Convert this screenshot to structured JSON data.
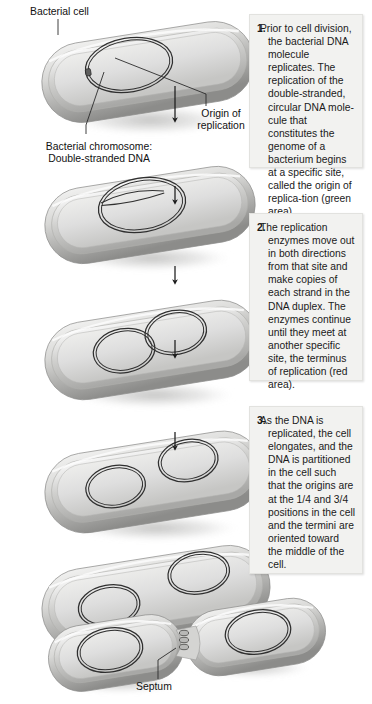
{
  "figure": {
    "background_color": "#ffffff"
  },
  "labels": {
    "bacterial_cell": "Bacterial cell",
    "origin_of_replication": "Origin of\nreplication",
    "bacterial_chromosome": "Bacterial chromosome:\nDouble-stranded DNA",
    "septum": "Septum"
  },
  "panels": [
    {
      "number": "1.",
      "text": "Prior to cell division, the bacterial DNA molecule replicates. The replication of the double-stranded, circular DNA mole-cule that constitutes the genome of a bacterium begins at a specific site, called the origin of replica-tion (green area)."
    },
    {
      "number": "2.",
      "text": "The replication enzymes move out in both directions from that site and make copies of each strand in the DNA duplex. The enzymes continue until they meet at another specific site, the terminus of replication (red area)."
    },
    {
      "number": "3.",
      "text": "As the DNA is replicated, the cell elongates, and the DNA is partitioned in the cell such that the origins are at the 1/4 and 3/4 positions in the cell and the termini are oriented toward the middle of the cell."
    }
  ],
  "stages": [
    {
      "id": "stage-1",
      "caption": "Single circular chromosome with origin of replication",
      "dna_loops": 1
    },
    {
      "id": "stage-2",
      "caption": "Replication begins, bubble forms at origin",
      "dna_loops": 1
    },
    {
      "id": "stage-3",
      "caption": "Two overlapping replicating loops",
      "dna_loops": 2
    },
    {
      "id": "stage-4",
      "caption": "Two separating chromosome loops",
      "dna_loops": 2
    },
    {
      "id": "stage-5",
      "caption": "Cell elongates, chromosomes at 1/4 and 3/4 positions",
      "dna_loops": 2
    },
    {
      "id": "stage-6",
      "caption": "Septum forms, cell divides into two daughter cells",
      "dna_loops": 2
    }
  ],
  "arrows": [
    {
      "id": "arrow-1"
    },
    {
      "id": "arrow-2"
    },
    {
      "id": "arrow-3"
    },
    {
      "id": "arrow-4"
    },
    {
      "id": "arrow-5"
    }
  ],
  "colors": {
    "panel_background": "#f2f2f0",
    "panel_border": "#e2e2df",
    "cell_light": "#e6e6e4",
    "cell_mid": "#c8c8c6",
    "cell_dark": "#8e8e8c",
    "dna_stroke": "#2a2a2a",
    "text": "#111111",
    "arrow": "#1c1c1c"
  }
}
